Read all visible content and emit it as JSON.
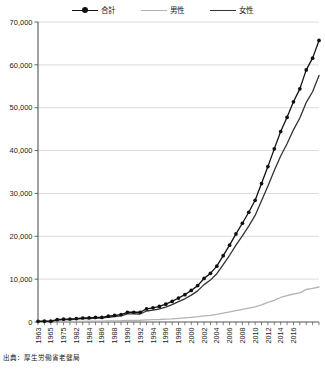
{
  "chart_data": {
    "type": "line",
    "title": "",
    "xlabel": "",
    "ylabel": "",
    "ylim": [
      0,
      70000
    ],
    "ytick_values": [
      0,
      10000,
      20000,
      30000,
      40000,
      50000,
      60000,
      70000
    ],
    "ytick_labels": [
      "0",
      "10,000",
      "20,000",
      "30,000",
      "40,000",
      "50,000",
      "60,000",
      "70,000"
    ],
    "grid": true,
    "legend_position": "top-center",
    "x": [
      1963,
      1964,
      1965,
      1975,
      1976,
      1977,
      1978,
      1979,
      1980,
      1981,
      1982,
      1983,
      1984,
      1985,
      1986,
      1987,
      1988,
      1989,
      1990,
      1991,
      1992,
      1993,
      1994,
      1995,
      1996,
      1997,
      1998,
      1999,
      2000,
      2001,
      2002,
      2003,
      2004,
      2005,
      2006,
      2007,
      2008,
      2009,
      2010,
      2011,
      2012,
      2013,
      2014,
      2015,
      2016
    ],
    "xtick_labels": [
      "1963",
      "1965",
      "1975",
      "1982",
      "1984",
      "1986",
      "1988",
      "1990",
      "1992",
      "1994",
      "1996",
      "1998",
      "2000",
      "2002",
      "2004",
      "2006",
      "2008",
      "2010",
      "2012",
      "2014",
      "2016"
    ],
    "xtick_label_rotation": -90,
    "series": [
      {
        "name": "合計",
        "color": "#111111",
        "marker": "circle",
        "width": 1.3,
        "values": [
          153,
          191,
          198,
          548,
          667,
          697,
          792,
          937,
          968,
          1072,
          1072,
          1354,
          1562,
          1740,
          2271,
          2271,
          2271,
          3078,
          3298,
          3625,
          4152,
          4802,
          5593,
          6378,
          7373,
          8491,
          10158,
          11346,
          13036,
          15475,
          17934,
          20561,
          23038,
          25606,
          28395,
          32295,
          36276,
          40399,
          44449,
          47756,
          51376,
          54397,
          58820,
          61568,
          65692
        ],
        "unit": "人"
      },
      {
        "name": "男性",
        "color": "#b3b3b3",
        "marker": "none",
        "width": 1.3,
        "values": [
          20,
          25,
          26,
          102,
          114,
          120,
          132,
          157,
          174,
          182,
          190,
          242,
          276,
          303,
          378,
          392,
          409,
          509,
          548,
          589,
          667,
          745,
          857,
          965,
          1100,
          1237,
          1431,
          1567,
          1765,
          2096,
          2364,
          2644,
          2950,
          3232,
          3532,
          4018,
          4568,
          5040,
          5724,
          6162,
          6534,
          6791,
          7586,
          7840,
          8167
        ],
        "unit": "人"
      },
      {
        "name": "女性",
        "color": "#333333",
        "marker": "none",
        "width": 1.3,
        "values": [
          133,
          166,
          172,
          446,
          553,
          577,
          660,
          780,
          794,
          890,
          882,
          1112,
          1286,
          1437,
          1893,
          1879,
          1862,
          2569,
          2750,
          3036,
          3485,
          4057,
          4736,
          5413,
          6273,
          7254,
          8727,
          9779,
          11271,
          13379,
          15570,
          17917,
          20088,
          22374,
          24863,
          28277,
          31708,
          35359,
          38725,
          41594,
          44842,
          47606,
          51234,
          53728,
          57525
        ],
        "unit": "人"
      }
    ]
  },
  "legend": {
    "items": [
      {
        "label": "合計",
        "color": "#111111",
        "has_marker": true
      },
      {
        "label": "男性",
        "color": "#b3b3b3",
        "has_marker": false
      },
      {
        "label": "女性",
        "color": "#333333",
        "has_marker": false
      }
    ]
  },
  "source": {
    "text": "出典：厚生労働省老健局"
  },
  "colors": {
    "background": "#ffffff",
    "axis": "#555555",
    "grid": "#cccccc",
    "text": "#1a1a1a"
  }
}
